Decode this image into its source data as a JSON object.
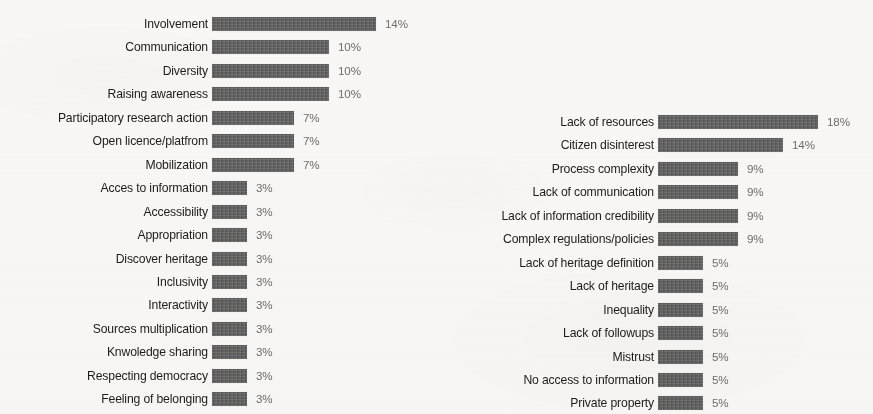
{
  "page": {
    "background_color": "#f8f7f5",
    "bar_color": "#5c5c5c",
    "label_color": "#1c1c1c",
    "value_color": "#6d6d6d"
  },
  "chart_data": [
    {
      "id": "left",
      "type": "bar",
      "orientation": "horizontal",
      "title": "",
      "xlabel": "",
      "ylabel": "",
      "grid": false,
      "legend": "none",
      "value_suffix": "%",
      "xlim": [
        0,
        14
      ],
      "categories": [
        "Involvement",
        "Communication",
        "Diversity",
        "Raising awareness",
        "Participatory research action",
        "Open licence/platfrom",
        "Mobilization",
        "Acces to information",
        "Accessibility",
        "Appropriation",
        "Discover heritage",
        "Inclusivity",
        "Interactivity",
        "Sources multiplication",
        "Knwoledge sharing",
        "Respecting democracy",
        "Feeling of belonging"
      ],
      "values": [
        14,
        10,
        10,
        10,
        7,
        7,
        7,
        3,
        3,
        3,
        3,
        3,
        3,
        3,
        3,
        3,
        3
      ],
      "value_labels": [
        "14%",
        "10%",
        "10%",
        "10%",
        "7%",
        "7%",
        "7%",
        "3%",
        "3%",
        "3%",
        "3%",
        "3%",
        "3%",
        "3%",
        "3%",
        "3%",
        "3%"
      ]
    },
    {
      "id": "right",
      "type": "bar",
      "orientation": "horizontal",
      "title": "",
      "xlabel": "",
      "ylabel": "",
      "grid": false,
      "legend": "none",
      "value_suffix": "%",
      "xlim": [
        0,
        18
      ],
      "categories": [
        "Lack of resources",
        "Citizen disinterest",
        "Process complexity",
        "Lack of communication",
        "Lack of information credibility",
        "Complex regulations/policies",
        "Lack of heritage definition",
        "Lack of heritage",
        "Inequality",
        "Lack of followups",
        "Mistrust",
        "No access to information",
        "Private property"
      ],
      "values": [
        18,
        14,
        9,
        9,
        9,
        9,
        5,
        5,
        5,
        5,
        5,
        5,
        5
      ],
      "value_labels": [
        "18%",
        "14%",
        "9%",
        "9%",
        "9%",
        "9%",
        "5%",
        "5%",
        "5%",
        "5%",
        "5%",
        "5%",
        "5%"
      ]
    }
  ]
}
